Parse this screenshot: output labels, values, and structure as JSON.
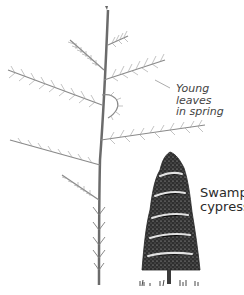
{
  "figure": {
    "annotations": [
      {
        "id": "young-leaves",
        "line1": "Young leaves",
        "line2": "in spring"
      },
      {
        "id": "species",
        "line1": "Swamp",
        "line2": "cypress"
      }
    ],
    "colors": {
      "stem": "#6b6b6b",
      "leaves": "#8a8a8a",
      "tree_fill": "#3a3a3a",
      "tree_highlight": "#ffffff",
      "text": "#3a3a3a"
    }
  }
}
